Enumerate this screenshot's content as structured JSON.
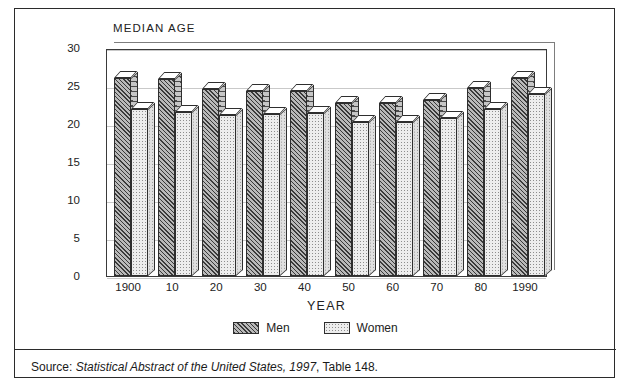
{
  "figure": {
    "axis_title": "MEDIAN AGE",
    "xaxis_label": "YEAR",
    "source_prefix": "Source:",
    "source_italic": "Statistical Abstract of the United States, 1997",
    "source_suffix": ", Table 148."
  },
  "legend": {
    "items": [
      {
        "label": "Men",
        "swatch": "hatched-dark"
      },
      {
        "label": "Women",
        "swatch": "dotted-light"
      }
    ]
  },
  "chart_data": {
    "type": "bar",
    "title": "MEDIAN AGE",
    "xlabel": "YEAR",
    "ylabel": "MEDIAN AGE",
    "ylim": [
      0,
      30
    ],
    "yticks": [
      0,
      5,
      10,
      15,
      20,
      25,
      30
    ],
    "ytick_labels": [
      "0",
      "5",
      "10",
      "15",
      "20",
      "25",
      "30"
    ],
    "grid": true,
    "legend_position": "bottom-center",
    "categories": [
      "1900",
      "10",
      "20",
      "30",
      "40",
      "50",
      "60",
      "70",
      "80",
      "1990"
    ],
    "series": [
      {
        "name": "Men",
        "values": [
          26.1,
          25.9,
          24.6,
          24.3,
          24.3,
          22.8,
          22.8,
          23.2,
          24.7,
          26.1
        ]
      },
      {
        "name": "Women",
        "values": [
          22.0,
          21.6,
          21.2,
          21.3,
          21.5,
          20.3,
          20.3,
          20.8,
          22.0,
          23.9
        ]
      }
    ]
  },
  "colors": {
    "frame": "#2b2b2b",
    "gridline": "#c9c9c9",
    "men_fill": "#b9b9b9",
    "women_fill": "#ededed",
    "text": "#1a1a1a"
  }
}
